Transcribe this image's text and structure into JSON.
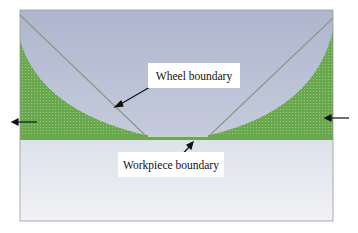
{
  "figure": {
    "labels": {
      "wheel": "Wheel boundary",
      "workpiece": "Workpiece boundary"
    },
    "colors": {
      "wheel_region": "#b9c1d6",
      "workpiece_region": "#e6e9ef",
      "green_band": "#6aa84f",
      "boundary_line": "#8a9a86",
      "frame": "#9a9a9a",
      "arrow": "#111111"
    },
    "arrows": [
      {
        "name": "wheel-boundary-pointer",
        "direction": "down-left"
      },
      {
        "name": "workpiece-boundary-pointer",
        "direction": "up-right"
      },
      {
        "name": "left-motion-arrow",
        "direction": "left"
      },
      {
        "name": "right-motion-arrow",
        "direction": "left"
      }
    ]
  }
}
